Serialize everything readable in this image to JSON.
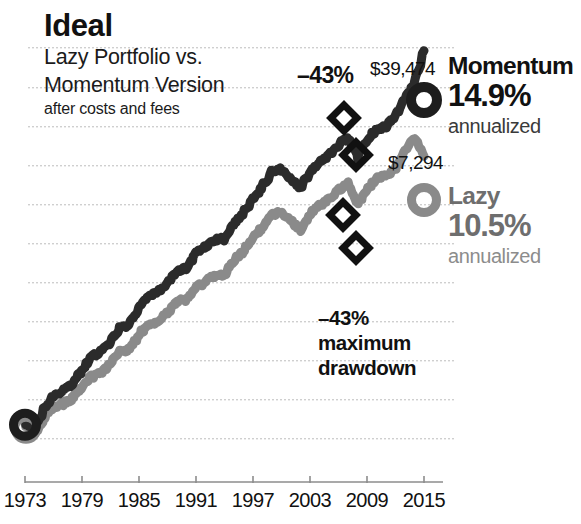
{
  "header": {
    "title": "Ideal",
    "subtitle_line1": "Lazy Portfolio vs.",
    "subtitle_line2": "Momentum Version",
    "subnote": "after costs and fees"
  },
  "annotations": {
    "drawdown_top": "–43%",
    "drawdown_block_line1": "–43%",
    "drawdown_block_line2": "maximum",
    "drawdown_block_line3": "drawdown"
  },
  "callouts": {
    "momentum_value": "$39,474",
    "lazy_value": "$7,294"
  },
  "legend": {
    "momentum": {
      "name": "Momentum",
      "pct": "14.9%",
      "annualized": "annualized",
      "color": "#111111"
    },
    "lazy": {
      "name": "Lazy",
      "pct": "10.5%",
      "annualized": "annualized",
      "color": "#6e6e6e"
    }
  },
  "chart_data": {
    "type": "line",
    "title": "Ideal",
    "subtitle": "Lazy Portfolio vs. Momentum Version",
    "note": "after costs and fees",
    "xlabel": "",
    "ylabel": "",
    "log_scale": true,
    "grid": true,
    "grid_style": "dotted-horizontal",
    "legend_position": "right",
    "xlim": [
      1973,
      2015
    ],
    "xticks": [
      1973,
      1979,
      1985,
      1991,
      1997,
      2003,
      2009,
      2015
    ],
    "xtick_labels": [
      "1973",
      "1979",
      "1985",
      "1991",
      "1997",
      "2003",
      "2009",
      "2015"
    ],
    "start_value": 100,
    "end_values": {
      "Momentum": 39474,
      "Lazy": 7294
    },
    "annualized_returns": {
      "Momentum": "14.9%",
      "Lazy": "10.5%"
    },
    "max_drawdown": {
      "Momentum": "-43%",
      "Lazy": "-43%"
    },
    "series": [
      {
        "name": "Momentum",
        "color": "#2b2b2b",
        "marker_end": "donut",
        "x": [
          1973,
          1974,
          1975,
          1976,
          1977,
          1978,
          1979,
          1980,
          1981,
          1982,
          1983,
          1984,
          1985,
          1986,
          1987,
          1988,
          1989,
          1990,
          1991,
          1992,
          1993,
          1994,
          1995,
          1996,
          1997,
          1998,
          1999,
          2000,
          2001,
          2002,
          2003,
          2004,
          2005,
          2006,
          2007,
          2008,
          2009,
          2010,
          2011,
          2012,
          2013,
          2014,
          2015
        ],
        "values": [
          100,
          96,
          128,
          160,
          172,
          192,
          240,
          300,
          320,
          380,
          470,
          500,
          640,
          780,
          830,
          960,
          1180,
          1210,
          1560,
          1720,
          1930,
          1950,
          2500,
          2950,
          3700,
          4500,
          5700,
          5900,
          5100,
          4400,
          5700,
          6600,
          7500,
          8800,
          9900,
          7200,
          9400,
          11200,
          11800,
          13900,
          18500,
          23800,
          39474
        ]
      },
      {
        "name": "Lazy",
        "color": "#8a8a8a",
        "marker_end": "donut",
        "x": [
          1973,
          1974,
          1975,
          1976,
          1977,
          1978,
          1979,
          1980,
          1981,
          1982,
          1983,
          1984,
          1985,
          1986,
          1987,
          1988,
          1989,
          1990,
          1991,
          1992,
          1993,
          1994,
          1995,
          1996,
          1997,
          1998,
          1999,
          2000,
          2001,
          2002,
          2003,
          2004,
          2005,
          2006,
          2007,
          2008,
          2009,
          2010,
          2011,
          2012,
          2013,
          2014,
          2015
        ],
        "values": [
          100,
          88,
          110,
          134,
          140,
          152,
          180,
          215,
          228,
          268,
          320,
          336,
          420,
          500,
          520,
          600,
          720,
          730,
          900,
          980,
          1090,
          1100,
          1380,
          1600,
          1980,
          2350,
          2900,
          2980,
          2600,
          2250,
          2880,
          3300,
          3680,
          4250,
          4700,
          3400,
          4350,
          5100,
          5300,
          6100,
          7900,
          9800,
          7294
        ]
      }
    ],
    "markers": [
      {
        "series": "Momentum",
        "shape": "diamond",
        "x_px": 344,
        "y_px": 118
      },
      {
        "series": "Momentum",
        "shape": "diamond",
        "x_px": 356,
        "y_px": 155
      },
      {
        "series": "Lazy",
        "shape": "diamond",
        "x_px": 343,
        "y_px": 215
      },
      {
        "series": "Lazy",
        "shape": "diamond",
        "x_px": 356,
        "y_px": 248
      }
    ]
  },
  "xaxis": {
    "ticks": [
      {
        "label": "1973",
        "x": 25
      },
      {
        "label": "1979",
        "x": 82
      },
      {
        "label": "1985",
        "x": 139
      },
      {
        "label": "1991",
        "x": 196
      },
      {
        "label": "1997",
        "x": 253
      },
      {
        "label": "2003",
        "x": 310
      },
      {
        "label": "2009",
        "x": 367
      },
      {
        "label": "2015",
        "x": 424
      }
    ]
  },
  "gridlines_y": [
    47,
    87,
    126,
    165,
    204,
    243,
    282,
    321,
    360,
    399,
    438
  ]
}
